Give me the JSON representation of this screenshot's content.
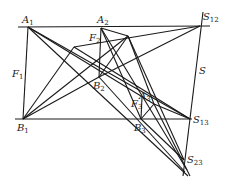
{
  "figure": {
    "type": "geometric construction (Desargues-style perspective diagram)",
    "labels": {
      "A1": {
        "main": "A",
        "sub": "1"
      },
      "A2": {
        "main": "A",
        "sub": "2"
      },
      "A3": {
        "main": "A",
        "sub": "3"
      },
      "B1": {
        "main": "B",
        "sub": "1"
      },
      "B2": {
        "main": "B",
        "sub": "2"
      },
      "B3": {
        "main": "B",
        "sub": "3"
      },
      "F1": {
        "main": "F",
        "sub": "1"
      },
      "F2": {
        "main": "F",
        "sub": "2"
      },
      "F3": {
        "main": "F",
        "sub": "3"
      },
      "S": {
        "main": "S",
        "sub": ""
      },
      "S12": {
        "main": "S",
        "sub": "12"
      },
      "S13": {
        "main": "S",
        "sub": "13"
      },
      "S23": {
        "main": "S",
        "sub": "23"
      }
    },
    "points": {
      "A1": [
        28,
        27
      ],
      "A2": [
        101,
        28
      ],
      "A3": [
        154,
        104
      ],
      "B1": [
        23,
        119
      ],
      "B2": [
        99,
        77
      ],
      "B3": [
        141,
        119
      ],
      "S12": [
        200,
        26
      ],
      "S13": [
        190,
        119
      ],
      "S23": [
        184,
        160
      ],
      "P": [
        128,
        36
      ],
      "Q": [
        74,
        47
      ]
    }
  }
}
